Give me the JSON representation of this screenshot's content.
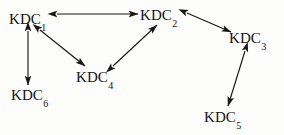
{
  "diagram": {
    "type": "node-link-graph",
    "title": "",
    "canvas": {
      "width": 284,
      "height": 135,
      "background": "#fdfdfc"
    },
    "stroke_color": "#1a1714",
    "nodes": [
      {
        "id": "KDC1",
        "base": "KDC",
        "subscript": "1",
        "label": "KDC1",
        "x": 32,
        "y": 20
      },
      {
        "id": "KDC2",
        "base": "KDC",
        "subscript": "2",
        "label": "KDC2",
        "x": 163,
        "y": 16
      },
      {
        "id": "KDC3",
        "base": "KDC",
        "subscript": "3",
        "label": "KDC3",
        "x": 252,
        "y": 39
      },
      {
        "id": "KDC4",
        "base": "KDC",
        "subscript": "4",
        "label": "KDC4",
        "x": 99,
        "y": 78
      },
      {
        "id": "KDC5",
        "base": "KDC",
        "subscript": "5",
        "label": "KDC5",
        "x": 227,
        "y": 118
      },
      {
        "id": "KDC6",
        "base": "KDC",
        "subscript": "6",
        "label": "KDC6",
        "x": 34,
        "y": 96
      }
    ],
    "edges": [
      {
        "id": "edge-kdc1-kdc2",
        "from": "KDC1",
        "to": "KDC2",
        "direction": "bidirectional",
        "x1": 57,
        "y1": 14,
        "x2": 138,
        "y2": 14
      },
      {
        "id": "edge-kdc2-kdc3",
        "from": "KDC2",
        "to": "KDC3",
        "direction": "bidirectional",
        "x1": 187,
        "y1": 13,
        "x2": 231,
        "y2": 32
      },
      {
        "id": "edge-kdc1-kdc4",
        "from": "KDC1",
        "to": "KDC4",
        "direction": "bidirectional",
        "x1": 40,
        "y1": 30,
        "x2": 85,
        "y2": 66
      },
      {
        "id": "edge-kdc4-kdc2",
        "from": "KDC4",
        "to": "KDC2",
        "direction": "bidirectional",
        "x1": 113,
        "y1": 66,
        "x2": 157,
        "y2": 25
      },
      {
        "id": "edge-kdc3-kdc5",
        "from": "KDC3",
        "to": "KDC5",
        "direction": "bidirectional",
        "x1": 245,
        "y1": 51,
        "x2": 228,
        "y2": 106
      },
      {
        "id": "edge-kdc1-kdc6",
        "from": "KDC1",
        "to": "KDC6",
        "direction": "bidirectional",
        "x1": 28,
        "y1": 31,
        "x2": 28,
        "y2": 85
      }
    ]
  }
}
